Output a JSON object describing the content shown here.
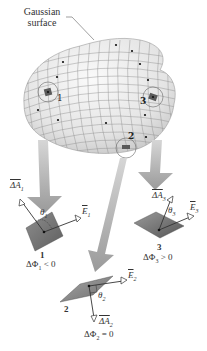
{
  "figure": {
    "callout_label_line1": "Gaussian",
    "callout_label_line2": "surface",
    "surface_points": [
      {
        "id": "1",
        "label": "1"
      },
      {
        "id": "2",
        "label": "2"
      },
      {
        "id": "3",
        "label": "3"
      }
    ],
    "elements": [
      {
        "id": "1",
        "number_label": "1",
        "area_vector": "ΔA",
        "area_sub": "1",
        "field_vector": "E",
        "field_sub": "1",
        "angle": "θ",
        "angle_sub": "1",
        "flux_text": "ΔΦ",
        "flux_sub": "1",
        "flux_relation": "< 0"
      },
      {
        "id": "2",
        "number_label": "2",
        "area_vector": "ΔA",
        "area_sub": "2",
        "field_vector": "E",
        "field_sub": "2",
        "angle": "θ",
        "angle_sub": "2",
        "flux_text": "ΔΦ",
        "flux_sub": "2",
        "flux_relation": "= 0"
      },
      {
        "id": "3",
        "number_label": "3",
        "area_vector": "ΔA",
        "area_sub": "3",
        "field_vector": "E",
        "field_sub": "3",
        "angle": "θ",
        "angle_sub": "3",
        "flux_text": "ΔΦ",
        "flux_sub": "3",
        "flux_relation": "> 0"
      }
    ],
    "colors": {
      "surface_fill": "#ececec",
      "grid_line": "#8a8a8a",
      "arrow_fill": "#a9a9a9",
      "patch_fill": "#7a7a7a",
      "text": "#222222"
    }
  }
}
